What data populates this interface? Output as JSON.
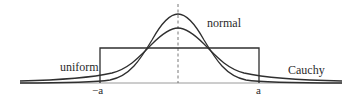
{
  "figure": {
    "colors": {
      "curve": "#2f2f2f",
      "axis": "#8a8a8a",
      "text": "#2b2b2b",
      "background": "#ffffff"
    },
    "curves": [
      {
        "name": "normal",
        "label": "normal",
        "shape": "bell, taller peak"
      },
      {
        "name": "cauchy",
        "label": "Cauchy",
        "shape": "bell, lower peak, heavy tails"
      },
      {
        "name": "uniform",
        "label": "uniform",
        "shape": "rectangle from -a to a"
      }
    ],
    "axis": {
      "ticks": [
        {
          "position": "left",
          "label": "−a"
        },
        {
          "position": "right",
          "label": "a"
        }
      ],
      "center_line": "dashed vertical line at 0"
    }
  }
}
